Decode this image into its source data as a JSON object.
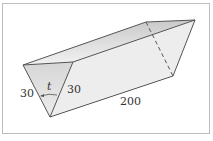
{
  "figure": {
    "labels": {
      "left_side": "30",
      "right_side": "30",
      "angle": "t",
      "length": "200"
    },
    "colors": {
      "edge": "#555555",
      "top_face": "#d4d4d4",
      "end_face": "#dcdcdc",
      "side_face": "#ececec",
      "frame": "#bdbdbd"
    }
  }
}
